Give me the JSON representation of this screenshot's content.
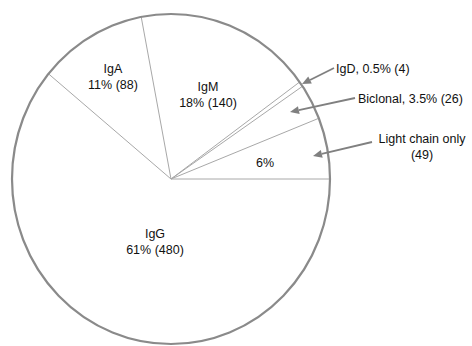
{
  "chart_data": {
    "type": "pie",
    "title": "",
    "start_angle_deg": 0,
    "direction": "counterclockwise",
    "slices": [
      {
        "name": "Light chain only",
        "percent": 6,
        "count": 49,
        "label_line1": "6%",
        "callout": "Light chain only",
        "callout2": "(49)"
      },
      {
        "name": "Biclonal",
        "percent": 3.5,
        "count": 26,
        "callout": "Biclonal, 3.5% (26)"
      },
      {
        "name": "IgD",
        "percent": 0.5,
        "count": 4,
        "callout": "IgD, 0.5% (4)"
      },
      {
        "name": "IgM",
        "percent": 18,
        "count": 140,
        "label_line1": "IgM",
        "label_line2": "18% (140)"
      },
      {
        "name": "IgA",
        "percent": 11,
        "count": 88,
        "label_line1": "IgA",
        "label_line2": "11% (88)"
      },
      {
        "name": "IgG",
        "percent": 61,
        "count": 480,
        "label_line1": "IgG",
        "label_line2": "61% (480)"
      }
    ],
    "colors": {
      "fill": "#ffffff",
      "rim": "#8a8a8a",
      "divider": "#a8a8a8",
      "arrow": "#808080",
      "text": "#111111"
    }
  }
}
